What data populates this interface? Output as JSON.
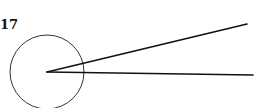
{
  "figure": {
    "label": "17",
    "circle": {
      "cx": 47,
      "cy": 72,
      "r": 37,
      "stroke": "#333333"
    },
    "vertex": {
      "x": 47,
      "y": 72
    },
    "rays": [
      {
        "name": "upper-ray",
        "x2": 247,
        "y2": 24
      },
      {
        "name": "lower-ray",
        "x2": 253,
        "y2": 75
      }
    ],
    "ray_color": "#111111"
  }
}
